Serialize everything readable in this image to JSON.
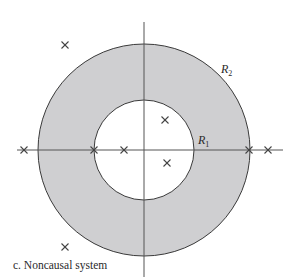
{
  "figure": {
    "caption": "c. Noncausal system",
    "labels": {
      "r1": {
        "base": "R",
        "sub": "1"
      },
      "r2": {
        "base": "R",
        "sub": "2"
      }
    },
    "colors": {
      "annulus_fill": "#cfcfd1",
      "stroke": "#3a3a3a",
      "axis": "#555555",
      "pole": "#444444"
    },
    "geometry": {
      "center": [
        144,
        150
      ],
      "inner_radius": 50,
      "outer_radius": 106,
      "h_axis": [
        17,
        283
      ],
      "v_axis": [
        22,
        277
      ]
    },
    "poles": [
      {
        "x": 65,
        "y": 45
      },
      {
        "x": 165,
        "y": 120
      },
      {
        "x": 167,
        "y": 163
      },
      {
        "x": 24,
        "y": 150
      },
      {
        "x": 94,
        "y": 150
      },
      {
        "x": 124,
        "y": 150
      },
      {
        "x": 249,
        "y": 150
      },
      {
        "x": 268,
        "y": 150
      },
      {
        "x": 65,
        "y": 247
      }
    ],
    "region_of_convergence": "R1 < |z| < R2 (annulus)"
  }
}
